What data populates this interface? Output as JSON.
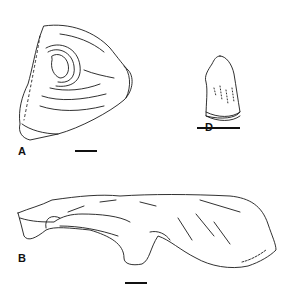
{
  "figure": {
    "panels": [
      {
        "label": "A",
        "description": "fossil bone fragment, triangular view with concentric growth lines"
      },
      {
        "label": "B",
        "description": "fossil bone fragment, elongate lateral view"
      },
      {
        "label": "D",
        "description": "fossil tooth crown"
      }
    ],
    "ink_color": "#111111",
    "background_color": "#ffffff"
  }
}
